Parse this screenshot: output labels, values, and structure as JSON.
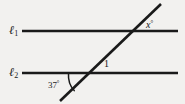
{
  "figure": {
    "kind": "geometry-diagram",
    "background_color": "#f2f1ef",
    "stroke_color": "#1a1a1a",
    "lines": [
      {
        "id": "l1",
        "label_text": "ℓ",
        "label_subscript": "1",
        "orientation": "horizontal",
        "x1": 22,
        "y1": 31,
        "x2": 178,
        "y2": 31
      },
      {
        "id": "l2",
        "label_text": "ℓ",
        "label_subscript": "2",
        "orientation": "horizontal",
        "x1": 22,
        "y1": 73,
        "x2": 178,
        "y2": 73
      },
      {
        "id": "transversal",
        "label_text": "",
        "label_subscript": "",
        "orientation": "diagonal",
        "x1": 60,
        "y1": 101,
        "x2": 161,
        "y2": 4
      }
    ],
    "angles": [
      {
        "id": "angle-x",
        "value": "x",
        "degree_symbol": "°",
        "position": "above-l1-right-of-transversal",
        "has_arc": false
      },
      {
        "id": "angle-1",
        "value": "1",
        "degree_symbol": "",
        "position": "above-l2-right-of-transversal",
        "has_arc": false
      },
      {
        "id": "angle-37",
        "value": "37",
        "degree_symbol": "°",
        "position": "below-l2-left-of-transversal",
        "has_arc": true
      }
    ]
  }
}
